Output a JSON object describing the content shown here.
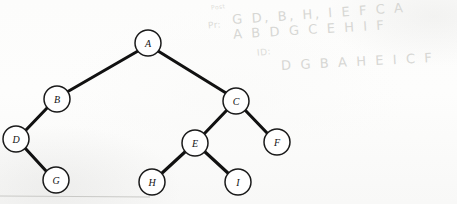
{
  "figure": {
    "type": "binary-tree-diagram",
    "medium": "scanned-page-with-pencil-annotations",
    "background_color": "#fdfdfc",
    "ink_color": "#111111",
    "node_fill": "#ffffff",
    "pencil_color": "#d7d7d4"
  },
  "tree": {
    "root": "A",
    "nodes": [
      {
        "id": "A",
        "label": "A",
        "cx": 148,
        "cy": 43,
        "r": 13
      },
      {
        "id": "B",
        "label": "B",
        "cx": 57,
        "cy": 99,
        "r": 13
      },
      {
        "id": "C",
        "label": "C",
        "cx": 236,
        "cy": 101,
        "r": 13
      },
      {
        "id": "D",
        "label": "D",
        "cx": 16,
        "cy": 139,
        "r": 13
      },
      {
        "id": "E",
        "label": "E",
        "cx": 195,
        "cy": 143,
        "r": 13
      },
      {
        "id": "F",
        "label": "F",
        "cx": 277,
        "cy": 142,
        "r": 13
      },
      {
        "id": "G",
        "label": "G",
        "cx": 56,
        "cy": 180,
        "r": 13
      },
      {
        "id": "H",
        "label": "H",
        "cx": 152,
        "cy": 182,
        "r": 13
      },
      {
        "id": "I",
        "label": "I",
        "cx": 238,
        "cy": 182,
        "r": 13
      }
    ],
    "edges": [
      {
        "from": "A",
        "to": "B",
        "side": "left"
      },
      {
        "from": "A",
        "to": "C",
        "side": "right"
      },
      {
        "from": "B",
        "to": "D",
        "side": "left"
      },
      {
        "from": "D",
        "to": "G",
        "side": "right"
      },
      {
        "from": "C",
        "to": "E",
        "side": "left"
      },
      {
        "from": "C",
        "to": "F",
        "side": "right"
      },
      {
        "from": "E",
        "to": "H",
        "side": "left"
      },
      {
        "from": "E",
        "to": "I",
        "side": "right"
      }
    ]
  },
  "annotations": {
    "postorder": {
      "tag": "Post",
      "sequence": "G D, B, H, I E F C A"
    },
    "preorder": {
      "tag": "Pr:",
      "sequence": "A B D G C E H I F"
    },
    "inorder": {
      "tag": "ID:",
      "sequence": "D G B A H E I C F"
    }
  }
}
